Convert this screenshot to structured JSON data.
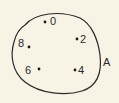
{
  "diagram": {
    "set": {
      "name": "A",
      "stroke": "#2a2a2a",
      "background": "#f7f4e6"
    },
    "elements": [
      {
        "label": "0",
        "dot": [
          45,
          22
        ],
        "text": [
          50,
          24
        ]
      },
      {
        "label": "2",
        "dot": [
          77,
          39
        ],
        "text": [
          80,
          43
        ]
      },
      {
        "label": "4",
        "dot": [
          75,
          70
        ],
        "text": [
          78,
          74
        ]
      },
      {
        "label": "6",
        "dot": [
          39,
          69
        ],
        "text": [
          25,
          73
        ]
      },
      {
        "label": "8",
        "dot": [
          29,
          47
        ],
        "text": [
          18,
          47
        ]
      }
    ],
    "set_label_position": [
      103,
      66
    ]
  }
}
